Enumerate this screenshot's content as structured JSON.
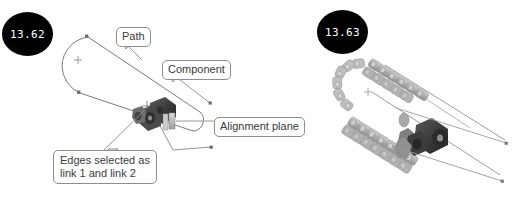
{
  "page": {
    "background_color": "#ffffff",
    "width": 520,
    "height": 209
  },
  "figures": [
    {
      "id": "figure-left",
      "badge_label": "13.62",
      "badge_color": "#000000",
      "badge_text_color": "#ffffff",
      "caption_note": "Path with component, alignment plane and selected link edges"
    },
    {
      "id": "figure-right",
      "badge_label": "13.63",
      "badge_color": "#000000",
      "badge_text_color": "#ffffff",
      "caption_note": "Resulting chain pattern of components along the path"
    }
  ],
  "callouts": [
    {
      "id": "path",
      "label": "Path"
    },
    {
      "id": "component",
      "label": "Component"
    },
    {
      "id": "alignment",
      "label": "Alignment plane"
    },
    {
      "id": "edges",
      "line1": "Edges selected as",
      "line2": "link 1 and link 2"
    }
  ],
  "geometry": {
    "path_stroke": "#7c7c7c",
    "leader_stroke": "#8a8a8a",
    "vertex_marker": "#6e6e6e",
    "component_dark": "#3d3d3d",
    "chain_light": "#b9b9b9",
    "chain_mid": "#9a9a9a"
  }
}
